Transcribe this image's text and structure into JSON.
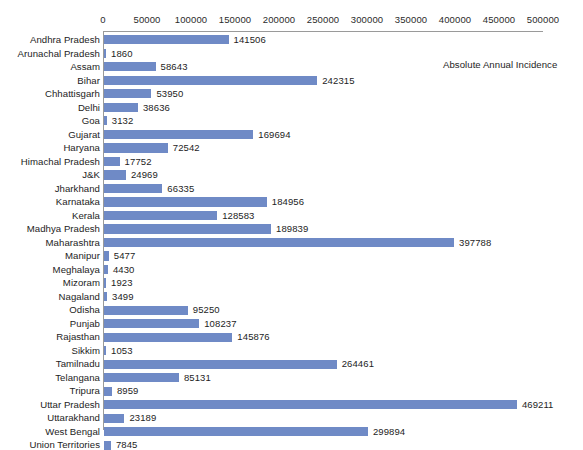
{
  "chart_data": {
    "type": "bar",
    "orientation": "horizontal",
    "title": "",
    "xlabel": "",
    "ylabel": "",
    "xlim": [
      0,
      500000
    ],
    "grid": false,
    "legend": {
      "position": "top-right",
      "entries": [
        "Absolute Annual Incidence"
      ]
    },
    "series_name": "Absolute Annual Incidence",
    "bar_color": "#6f8ac6",
    "axis_color": "#9a9a9a",
    "tick_labels": [
      "0",
      "50000",
      "100000",
      "150000",
      "200000",
      "250000",
      "300000",
      "350000",
      "400000",
      "450000",
      "500000"
    ],
    "tick_values": [
      0,
      50000,
      100000,
      150000,
      200000,
      250000,
      300000,
      350000,
      400000,
      450000,
      500000
    ],
    "categories": [
      "Andhra Pradesh",
      "Arunachal Pradesh",
      "Assam",
      "Bihar",
      "Chhattisgarh",
      "Delhi",
      "Goa",
      "Gujarat",
      "Haryana",
      "Himachal Pradesh",
      "J&K",
      "Jharkhand",
      "Karnataka",
      "Kerala",
      "Madhya Pradesh",
      "Maharashtra",
      "Manipur",
      "Meghalaya",
      "Mizoram",
      "Nagaland",
      "Odisha",
      "Punjab",
      "Rajasthan",
      "Sikkim",
      "Tamilnadu",
      "Telangana",
      "Tripura",
      "Uttar Pradesh",
      "Uttarakhand",
      "West Bengal",
      "Union Territories"
    ],
    "values": [
      141506,
      1860,
      58643,
      242315,
      53950,
      38636,
      3132,
      169694,
      72542,
      17752,
      24969,
      66335,
      184956,
      128583,
      189839,
      397788,
      5477,
      4430,
      1923,
      3499,
      95250,
      108237,
      145876,
      1053,
      264461,
      85131,
      8959,
      469211,
      23189,
      299894,
      7845
    ],
    "value_labels": [
      "141506",
      "1860",
      "58643",
      "242315",
      "53950",
      "38636",
      "3132",
      "169694",
      "72542",
      "17752",
      "24969",
      "66335",
      "184956",
      "128583",
      "189839",
      "397788",
      "5477",
      "4430",
      "1923",
      "3499",
      "95250",
      "108237",
      "145876",
      "1053",
      "264461",
      "85131",
      "8959",
      "469211",
      "23189",
      "299894",
      "7845"
    ]
  }
}
